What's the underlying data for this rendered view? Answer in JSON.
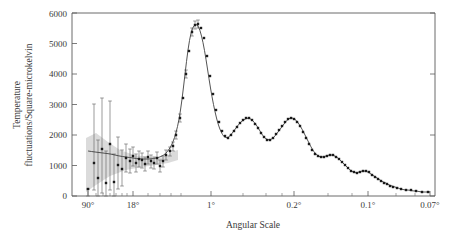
{
  "figure": {
    "title": "",
    "xlabel": "Angular Scale",
    "ylabel_line1": "Temperature",
    "ylabel_line2": "fluctuations/Square-microkelvin",
    "ylabel_full": "Temperature fluctuations/Square-microkelvin",
    "curve_color": "#404040",
    "marker_color": "#1a1a1a",
    "band_color": "#d9d9d9",
    "frame_color": "#5a5a5a"
  },
  "chart_data": {
    "type": "line",
    "title": "",
    "xlabel": "Angular Scale",
    "ylabel": "Temperature fluctuations/Square-microkelvin",
    "grid": false,
    "legend": "none",
    "x_scale": "log-inverse-angle",
    "ylim": [
      0,
      6000
    ],
    "ytick_labels": [
      "0",
      "1000",
      "2000",
      "3000",
      "4000",
      "5000",
      "6000"
    ],
    "ytick_values": [
      0,
      1000,
      2000,
      3000,
      4000,
      5000,
      6000
    ],
    "xtick_labels": [
      "90°",
      "18°",
      "1°",
      "0.2°",
      "0.1°",
      "0.07°"
    ],
    "xtick_positions_px": [
      88,
      133,
      211,
      294,
      368,
      430
    ],
    "band_description": "cosmic variance wedge at large angular scales",
    "series": [
      {
        "name": "model",
        "kind": "line",
        "points_px": [
          [
            88,
            151
          ],
          [
            95,
            152
          ],
          [
            103,
            153
          ],
          [
            111,
            154
          ],
          [
            119,
            156
          ],
          [
            126,
            157
          ],
          [
            133,
            158
          ],
          [
            140,
            159
          ],
          [
            146,
            159
          ],
          [
            151,
            159
          ],
          [
            156,
            158
          ],
          [
            160,
            157
          ],
          [
            164,
            155
          ],
          [
            167,
            152
          ],
          [
            170,
            148
          ],
          [
            173,
            142
          ],
          [
            176,
            133
          ],
          [
            179,
            120
          ],
          [
            182,
            100
          ],
          [
            185,
            74
          ],
          [
            188,
            49
          ],
          [
            191,
            32
          ],
          [
            194,
            25
          ],
          [
            197,
            24
          ],
          [
            200,
            30
          ],
          [
            203,
            42
          ],
          [
            206,
            59
          ],
          [
            209,
            79
          ],
          [
            212,
            97
          ],
          [
            215,
            112
          ],
          [
            218,
            124
          ],
          [
            221,
            132
          ],
          [
            224,
            137
          ],
          [
            227,
            138
          ],
          [
            230,
            136
          ],
          [
            233,
            132
          ],
          [
            236,
            128
          ],
          [
            239,
            124
          ],
          [
            242,
            121
          ],
          [
            245,
            119
          ],
          [
            248,
            118
          ],
          [
            251,
            119
          ],
          [
            254,
            122
          ],
          [
            257,
            126
          ],
          [
            260,
            131
          ],
          [
            263,
            136
          ],
          [
            266,
            139
          ],
          [
            269,
            140
          ],
          [
            272,
            139
          ],
          [
            275,
            136
          ],
          [
            278,
            132
          ],
          [
            281,
            128
          ],
          [
            284,
            124
          ],
          [
            287,
            120
          ],
          [
            290,
            118
          ],
          [
            293,
            118
          ],
          [
            296,
            120
          ],
          [
            299,
            124
          ],
          [
            302,
            129
          ],
          [
            305,
            135
          ],
          [
            308,
            141
          ],
          [
            311,
            147
          ],
          [
            314,
            152
          ],
          [
            317,
            155
          ],
          [
            320,
            157
          ],
          [
            323,
            157
          ],
          [
            326,
            156
          ],
          [
            329,
            155
          ],
          [
            332,
            155
          ],
          [
            335,
            156
          ],
          [
            338,
            158
          ],
          [
            341,
            161
          ],
          [
            344,
            164
          ],
          [
            347,
            167
          ],
          [
            350,
            170
          ],
          [
            353,
            172
          ],
          [
            356,
            173
          ],
          [
            359,
            172
          ],
          [
            362,
            171
          ],
          [
            365,
            171
          ],
          [
            368,
            172
          ],
          [
            371,
            174
          ],
          [
            374,
            176
          ],
          [
            377,
            178
          ],
          [
            380,
            180
          ],
          [
            383,
            182
          ],
          [
            386,
            183
          ],
          [
            389,
            185
          ],
          [
            392,
            186
          ],
          [
            395,
            187
          ],
          [
            398,
            188
          ],
          [
            401,
            189
          ],
          [
            405,
            190
          ],
          [
            409,
            190
          ],
          [
            413,
            191
          ],
          [
            417,
            191
          ],
          [
            421,
            192
          ],
          [
            425,
            192
          ],
          [
            430,
            192
          ]
        ]
      },
      {
        "name": "measurements",
        "kind": "scatter-with-errorbars",
        "points_px": [
          [
            88,
            189
          ],
          [
            94,
            163
          ],
          [
            98,
            178
          ],
          [
            102,
            149
          ],
          [
            106,
            183
          ],
          [
            110,
            144
          ],
          [
            114,
            182
          ],
          [
            118,
            165
          ],
          [
            122,
            169
          ],
          [
            126,
            158
          ],
          [
            130,
            161
          ],
          [
            133,
            156
          ],
          [
            136,
            163
          ],
          [
            139,
            159
          ],
          [
            142,
            160
          ],
          [
            145,
            164
          ],
          [
            148,
            157
          ],
          [
            151,
            161
          ],
          [
            154,
            163
          ],
          [
            157,
            158
          ],
          [
            160,
            166
          ],
          [
            163,
            161
          ],
          [
            166,
            155
          ],
          [
            170,
            151
          ],
          [
            173,
            146
          ],
          [
            176,
            135
          ],
          [
            180,
            118
          ],
          [
            183,
            98
          ],
          [
            186,
            74
          ],
          [
            189,
            51
          ],
          [
            192,
            32
          ],
          [
            195,
            25
          ],
          [
            198,
            24
          ],
          [
            201,
            28
          ],
          [
            204,
            38
          ],
          [
            207,
            56
          ],
          [
            210,
            76
          ],
          [
            213,
            94
          ],
          [
            216,
            110
          ],
          [
            219,
            122
          ],
          [
            222,
            131
          ],
          [
            225,
            136
          ],
          [
            228,
            138
          ],
          [
            231,
            135
          ],
          [
            234,
            131
          ],
          [
            237,
            127
          ],
          [
            240,
            123
          ],
          [
            243,
            120
          ],
          [
            246,
            118
          ],
          [
            249,
            118
          ],
          [
            252,
            120
          ],
          [
            255,
            124
          ],
          [
            258,
            128
          ],
          [
            261,
            133
          ],
          [
            264,
            137
          ],
          [
            267,
            140
          ],
          [
            270,
            140
          ],
          [
            273,
            138
          ],
          [
            276,
            134
          ],
          [
            279,
            130
          ],
          [
            282,
            126
          ],
          [
            285,
            122
          ],
          [
            288,
            119
          ],
          [
            291,
            118
          ],
          [
            294,
            119
          ],
          [
            297,
            122
          ],
          [
            300,
            126
          ],
          [
            303,
            132
          ],
          [
            306,
            138
          ],
          [
            309,
            144
          ],
          [
            312,
            150
          ],
          [
            315,
            154
          ],
          [
            318,
            156
          ],
          [
            321,
            157
          ],
          [
            324,
            157
          ],
          [
            327,
            156
          ],
          [
            330,
            155
          ],
          [
            333,
            155
          ],
          [
            336,
            157
          ],
          [
            339,
            159
          ],
          [
            342,
            162
          ],
          [
            345,
            165
          ],
          [
            348,
            168
          ],
          [
            351,
            171
          ],
          [
            354,
            172
          ],
          [
            357,
            173
          ],
          [
            360,
            172
          ],
          [
            363,
            171
          ],
          [
            366,
            171
          ],
          [
            369,
            172
          ],
          [
            372,
            175
          ],
          [
            375,
            177
          ],
          [
            378,
            179
          ],
          [
            381,
            181
          ],
          [
            384,
            183
          ],
          [
            387,
            184
          ],
          [
            390,
            186
          ],
          [
            393,
            187
          ],
          [
            397,
            188
          ],
          [
            401,
            189
          ],
          [
            406,
            190
          ],
          [
            411,
            190
          ],
          [
            416,
            191
          ],
          [
            422,
            192
          ],
          [
            428,
            192
          ]
        ],
        "errorbars_px": [
          [
            88,
            189,
            189,
            196
          ],
          [
            94,
            163,
            104,
            190
          ],
          [
            98,
            178,
            140,
            196
          ],
          [
            102,
            149,
            98,
            193
          ],
          [
            106,
            183,
            151,
            196
          ],
          [
            110,
            144,
            101,
            190
          ],
          [
            114,
            182,
            154,
            196
          ],
          [
            118,
            165,
            137,
            189
          ],
          [
            122,
            169,
            150,
            186
          ],
          [
            126,
            158,
            144,
            172
          ],
          [
            130,
            161,
            149,
            173
          ],
          [
            133,
            156,
            147,
            166
          ],
          [
            136,
            163,
            154,
            172
          ],
          [
            139,
            159,
            151,
            167
          ],
          [
            142,
            160,
            153,
            168
          ],
          [
            145,
            164,
            157,
            171
          ],
          [
            148,
            157,
            151,
            164
          ],
          [
            151,
            161,
            155,
            168
          ],
          [
            154,
            163,
            157,
            169
          ],
          [
            157,
            158,
            152,
            164
          ],
          [
            160,
            166,
            160,
            172
          ],
          [
            163,
            161,
            156,
            167
          ],
          [
            166,
            155,
            150,
            160
          ],
          [
            170,
            151,
            147,
            156
          ],
          [
            173,
            146,
            142,
            151
          ],
          [
            176,
            135,
            131,
            139
          ],
          [
            180,
            118,
            114,
            122
          ],
          [
            186,
            74,
            70,
            78
          ],
          [
            192,
            32,
            28,
            36
          ],
          [
            195,
            25,
            21,
            29
          ],
          [
            198,
            24,
            20,
            28
          ]
        ]
      }
    ],
    "features": {
      "plateau_value": 1000,
      "first_peak_value": 5750,
      "first_peak_position": "1°",
      "second_peak_value": 2500,
      "third_peak_value": 2450,
      "tail_value_at_0_07": 100
    }
  }
}
